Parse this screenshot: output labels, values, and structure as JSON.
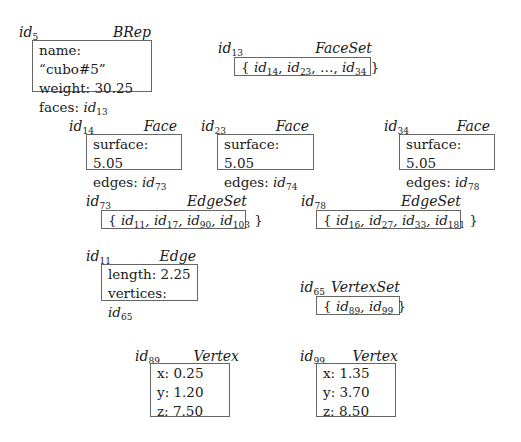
{
  "objects": {
    "brep": {
      "id": "id",
      "id_sub": "5",
      "type": "BRep",
      "rows": [
        {
          "label": "name:",
          "value": "“cubo#5”"
        },
        {
          "label": "weight:",
          "value": "30.25"
        },
        {
          "label": "faces:",
          "ref": "id",
          "ref_sub": "13"
        }
      ]
    },
    "faceset": {
      "id": "id",
      "id_sub": "13",
      "type": "FaceSet",
      "members": [
        {
          "ref": "id",
          "sub": "14"
        },
        {
          "ref": "id",
          "sub": "23"
        },
        {
          "ellipsis": "…"
        },
        {
          "ref": "id",
          "sub": "34"
        }
      ]
    },
    "face14": {
      "id": "id",
      "id_sub": "14",
      "type": "Face",
      "surface_label": "surface:",
      "surface": "5.05",
      "edges_label": "edges:",
      "edges_ref": "id",
      "edges_sub": "73"
    },
    "face23": {
      "id": "id",
      "id_sub": "23",
      "type": "Face",
      "surface_label": "surface:",
      "surface": "5.05",
      "edges_label": "edges:",
      "edges_ref": "id",
      "edges_sub": "74"
    },
    "face34": {
      "id": "id",
      "id_sub": "34",
      "type": "Face",
      "surface_label": "surface:",
      "surface": "5.05",
      "edges_label": "edges:",
      "edges_ref": "id",
      "edges_sub": "78"
    },
    "edgeset73": {
      "id": "id",
      "id_sub": "73",
      "type": "EdgeSet",
      "members": [
        "11",
        "17",
        "90",
        "103"
      ]
    },
    "edgeset78": {
      "id": "id",
      "id_sub": "78",
      "type": "EdgeSet",
      "members": [
        "16",
        "27",
        "33",
        "181"
      ]
    },
    "edge11": {
      "id": "id",
      "id_sub": "11",
      "type": "Edge",
      "length_label": "length:",
      "length": "2.25",
      "vertices_label": "vertices:",
      "vertices_ref": "id",
      "vertices_sub": "65"
    },
    "vertexset65": {
      "id": "id",
      "id_sub": "65",
      "type": "VertexSet",
      "members": [
        "89",
        "99"
      ]
    },
    "vertex89": {
      "id": "id",
      "id_sub": "89",
      "type": "Vertex",
      "x_label": "x:",
      "x": "0.25",
      "y_label": "y:",
      "y": "1.20",
      "z_label": "z:",
      "z": "7.50"
    },
    "vertex99": {
      "id": "id",
      "id_sub": "99",
      "type": "Vertex",
      "x_label": "x:",
      "x": "1.35",
      "y_label": "y:",
      "y": "3.70",
      "z_label": "z:",
      "z": "8.50"
    }
  },
  "punct": {
    "open": "{ ",
    "close": " }",
    "comma": ", "
  }
}
